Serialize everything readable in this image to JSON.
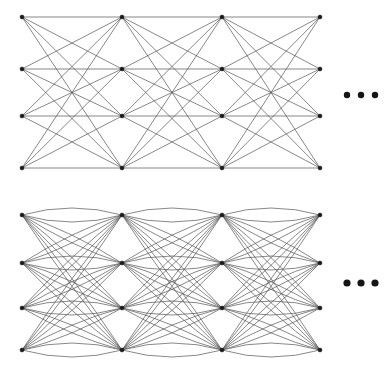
{
  "figure": {
    "background_color": "#ffffff",
    "edge_color": "#555555",
    "node_color": "#1a1a1a",
    "ellipsis_color": "#161616",
    "width": 389,
    "height": 371
  },
  "panels": [
    {
      "id": "panel-straight",
      "name": "straight-edge-graph",
      "edge_style": "straight",
      "continuation_symbol": "•••",
      "origin_y": 0,
      "columns_x": [
        22,
        122,
        222,
        320
      ],
      "rows_y": [
        17,
        69,
        116,
        168
      ],
      "nodes_per_column": 4,
      "column_count": 4,
      "bipartite_between_adjacent_columns": true,
      "ellipsis": {
        "x": [
          347,
          361,
          375
        ],
        "y": 95,
        "radius": 3.2
      }
    },
    {
      "id": "panel-curved",
      "name": "curved-edge-graph",
      "edge_style": "curved",
      "continuation_symbol": "•••",
      "origin_y": 185,
      "columns_x": [
        22,
        122,
        222,
        320
      ],
      "rows_y": [
        30,
        78,
        123,
        165
      ],
      "nodes_per_column": 4,
      "column_count": 4,
      "bipartite_between_adjacent_columns": true,
      "curvature": 14,
      "ellipsis": {
        "x": [
          347,
          361,
          375
        ],
        "y": 98,
        "radius": 3.6
      }
    }
  ],
  "chart_data": {
    "type": "diagram",
    "subtype": "layered-graph",
    "panels": [
      {
        "label": "straight-edge-graph",
        "layers": 4,
        "nodes_per_layer": 4,
        "total_nodes": 16,
        "edges_between_adjacent_layers": 16,
        "total_edges": 48,
        "edge_rendering": "straight line segments",
        "truncated": true
      },
      {
        "label": "curved-edge-graph",
        "layers": 4,
        "nodes_per_layer": 4,
        "total_nodes": 16,
        "edges_between_adjacent_layers": 16,
        "total_edges": 48,
        "edge_rendering": "quadratic arcs",
        "truncated": true
      }
    ]
  }
}
